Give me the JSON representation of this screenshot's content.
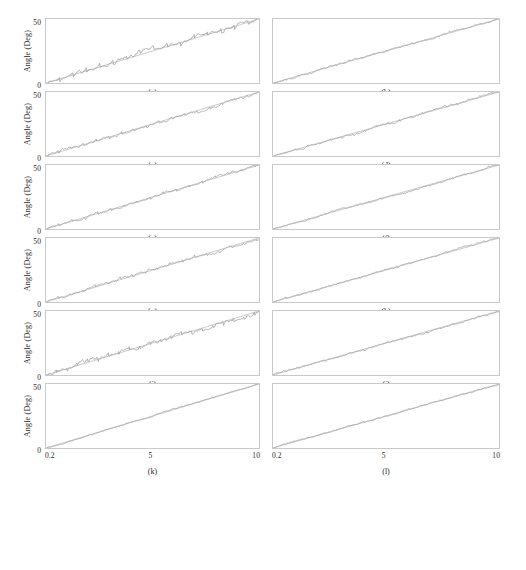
{
  "figure": {
    "axis": {
      "ylabel": "Angle (Deg)",
      "ytick_top": "50",
      "ytick_bottom": "0",
      "xtick_left": "0.2",
      "xtick_mid": "5",
      "xtick_right": "10",
      "ylim": [
        0,
        50
      ],
      "xlim": [
        0.2,
        10
      ],
      "grid": false
    },
    "style": {
      "frame_color": "#c9c9c9",
      "reference_color": "#b9b9b9",
      "signal_color": "#a8a8a8",
      "background": "#ffffff",
      "text_color": "#1e1e1e"
    },
    "rows": 6,
    "columns": 2,
    "panels": [
      {
        "id": "a",
        "caption": "(a)",
        "column": "left",
        "row": 0,
        "noise": 2.6,
        "ripple": 2.2,
        "ripple_period": 0.62,
        "slope_jitter": 0.55,
        "seed": 11
      },
      {
        "id": "b",
        "caption": "(b)",
        "column": "right",
        "row": 0,
        "noise": 1.1,
        "ripple": 0.75,
        "ripple_period": 0.55,
        "slope_jitter": 0.3,
        "seed": 23
      },
      {
        "id": "c",
        "caption": "(c)",
        "column": "left",
        "row": 1,
        "noise": 1.7,
        "ripple": 1.25,
        "ripple_period": 0.58,
        "slope_jitter": 0.42,
        "seed": 37
      },
      {
        "id": "d",
        "caption": "(d)",
        "column": "right",
        "row": 1,
        "noise": 1.2,
        "ripple": 0.85,
        "ripple_period": 0.5,
        "slope_jitter": 0.32,
        "seed": 41
      },
      {
        "id": "e",
        "caption": "(e)",
        "column": "left",
        "row": 2,
        "noise": 1.5,
        "ripple": 1.05,
        "ripple_period": 0.6,
        "slope_jitter": 0.38,
        "seed": 53
      },
      {
        "id": "f",
        "caption": "(f)",
        "column": "right",
        "row": 2,
        "noise": 1.0,
        "ripple": 0.7,
        "ripple_period": 0.52,
        "slope_jitter": 0.28,
        "seed": 67
      },
      {
        "id": "g",
        "caption": "(g)",
        "column": "left",
        "row": 3,
        "noise": 1.6,
        "ripple": 1.15,
        "ripple_period": 0.57,
        "slope_jitter": 0.4,
        "seed": 71
      },
      {
        "id": "h",
        "caption": "(h)",
        "column": "right",
        "row": 3,
        "noise": 1.0,
        "ripple": 0.72,
        "ripple_period": 0.54,
        "slope_jitter": 0.3,
        "seed": 83
      },
      {
        "id": "i",
        "caption": "(i)",
        "column": "left",
        "row": 4,
        "noise": 2.4,
        "ripple": 1.95,
        "ripple_period": 0.48,
        "slope_jitter": 0.6,
        "seed": 97
      },
      {
        "id": "j",
        "caption": "(j)",
        "column": "right",
        "row": 4,
        "noise": 1.1,
        "ripple": 0.78,
        "ripple_period": 0.56,
        "slope_jitter": 0.3,
        "seed": 103
      },
      {
        "id": "k",
        "caption": "(k)",
        "column": "left",
        "row": 5,
        "noise": 0.7,
        "ripple": 0.42,
        "ripple_period": 0.7,
        "slope_jitter": 0.22,
        "seed": 109
      },
      {
        "id": "l",
        "caption": "(l)",
        "column": "right",
        "row": 5,
        "noise": 0.8,
        "ripple": 0.5,
        "ripple_period": 0.66,
        "slope_jitter": 0.24,
        "seed": 127
      }
    ],
    "chart_data": {
      "type": "line",
      "title": "",
      "xlabel": "",
      "ylabel": "Angle (Deg)",
      "xlim": [
        0.2,
        10
      ],
      "ylim": [
        0,
        50
      ],
      "xticks": [
        0.2,
        5,
        10
      ],
      "yticks": [
        0,
        50
      ],
      "grid": false,
      "legend": "none",
      "description": "Twelve subplots (a)-(l), each showing a commanded reference angle ramping linearly from 0 deg at x=0.2 to 50 deg at x=10, overlaid with a measured/tracking angle that follows the ramp with small oscillatory ripple and noise.",
      "x": [
        0.2,
        0.69,
        1.18,
        1.67,
        2.16,
        2.65,
        3.14,
        3.63,
        4.12,
        4.61,
        5.1,
        5.59,
        6.08,
        6.57,
        7.06,
        7.55,
        8.04,
        8.53,
        9.02,
        9.51,
        10
      ],
      "series": [
        {
          "name": "reference",
          "panel": "all",
          "values": [
            0,
            2.5,
            5,
            7.5,
            10,
            12.5,
            15,
            17.5,
            20,
            22.5,
            25,
            27.5,
            30,
            32.5,
            35,
            37.5,
            40,
            42.5,
            45,
            47.5,
            50
          ]
        },
        {
          "name": "measured (a)",
          "panel": "a",
          "values": [
            0.2,
            2.1,
            5.6,
            7.1,
            10.8,
            12.0,
            15.7,
            17.1,
            20.6,
            22.1,
            25.8,
            27.0,
            30.7,
            32.2,
            35.6,
            37.1,
            40.7,
            42.1,
            45.6,
            47.2,
            49.6
          ]
        },
        {
          "name": "measured (b)",
          "panel": "b",
          "values": [
            0.1,
            2.6,
            4.7,
            7.7,
            9.8,
            12.8,
            14.8,
            17.8,
            19.8,
            22.8,
            24.8,
            27.8,
            29.8,
            32.8,
            34.8,
            37.8,
            39.8,
            42.8,
            44.8,
            47.8,
            49.9
          ]
        },
        {
          "name": "measured (c)",
          "panel": "c",
          "values": [
            0.1,
            2.2,
            5.4,
            7.2,
            10.5,
            12.2,
            15.4,
            17.2,
            20.5,
            22.2,
            25.5,
            27.2,
            30.4,
            32.3,
            35.4,
            37.2,
            40.4,
            42.3,
            45.4,
            47.3,
            49.7
          ]
        },
        {
          "name": "measured (d)",
          "panel": "d",
          "values": [
            0.1,
            2.6,
            4.8,
            7.7,
            9.9,
            12.7,
            14.9,
            17.7,
            19.9,
            22.7,
            24.9,
            27.7,
            29.9,
            32.7,
            34.9,
            37.7,
            39.9,
            42.7,
            44.9,
            47.7,
            49.9
          ]
        },
        {
          "name": "measured (e)",
          "panel": "e",
          "values": [
            0.1,
            2.3,
            5.2,
            7.3,
            10.3,
            12.3,
            15.3,
            17.3,
            20.3,
            22.3,
            25.3,
            27.3,
            30.3,
            32.4,
            35.3,
            37.3,
            40.3,
            42.4,
            45.3,
            47.4,
            49.8
          ]
        },
        {
          "name": "measured (f)",
          "panel": "f",
          "values": [
            0.1,
            2.6,
            4.8,
            7.6,
            9.9,
            12.6,
            14.9,
            17.6,
            19.9,
            22.6,
            24.9,
            27.6,
            29.9,
            32.6,
            34.9,
            37.6,
            39.9,
            42.6,
            44.9,
            47.6,
            49.9
          ]
        },
        {
          "name": "measured (g)",
          "panel": "g",
          "values": [
            0.1,
            2.3,
            5.3,
            7.2,
            10.4,
            12.3,
            15.4,
            17.2,
            20.4,
            22.3,
            25.4,
            27.2,
            30.4,
            32.3,
            35.4,
            37.3,
            40.4,
            42.3,
            45.4,
            47.3,
            49.8
          ]
        },
        {
          "name": "measured (h)",
          "panel": "h",
          "values": [
            0.1,
            2.6,
            4.8,
            7.7,
            9.9,
            12.7,
            14.9,
            17.7,
            19.9,
            22.7,
            24.9,
            27.7,
            29.9,
            32.7,
            34.9,
            37.7,
            39.9,
            42.7,
            44.9,
            47.7,
            49.9
          ]
        },
        {
          "name": "measured (i)",
          "panel": "i",
          "values": [
            0.3,
            2.0,
            5.7,
            6.9,
            10.9,
            11.9,
            15.8,
            16.9,
            20.8,
            22.0,
            25.9,
            26.9,
            30.8,
            32.1,
            35.7,
            37.0,
            40.8,
            42.0,
            45.7,
            47.1,
            49.5
          ]
        },
        {
          "name": "measured (j)",
          "panel": "j",
          "values": [
            0.1,
            2.6,
            4.8,
            7.7,
            9.8,
            12.8,
            14.8,
            17.8,
            19.8,
            22.8,
            24.8,
            27.8,
            29.8,
            32.8,
            34.8,
            37.8,
            39.8,
            42.8,
            44.8,
            47.8,
            49.9
          ]
        },
        {
          "name": "measured (k)",
          "panel": "k",
          "values": [
            0.1,
            2.5,
            5.0,
            7.4,
            10.1,
            12.4,
            15.1,
            17.4,
            20.1,
            22.4,
            25.1,
            27.4,
            30.1,
            32.5,
            35.1,
            37.5,
            40.1,
            42.5,
            45.1,
            47.5,
            49.9
          ]
        },
        {
          "name": "measured (l)",
          "panel": "l",
          "values": [
            0.1,
            2.5,
            5.0,
            7.4,
            10.1,
            12.5,
            15.0,
            17.5,
            20.0,
            22.5,
            25.0,
            27.5,
            30.0,
            32.5,
            35.0,
            37.5,
            40.0,
            42.5,
            45.0,
            47.5,
            49.9
          ]
        }
      ]
    }
  }
}
